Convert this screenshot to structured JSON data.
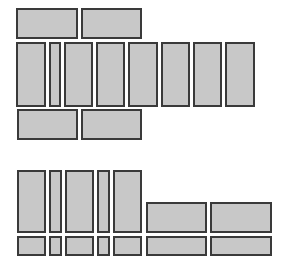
{
  "diagram": {
    "fill_color": "#c8c8c8",
    "border_color": "#3a3a3a",
    "background": "#ffffff",
    "groups": [
      {
        "name": "upper-group",
        "blocks": [
          {
            "x": 16,
            "y": 8,
            "w": 62,
            "h": 31
          },
          {
            "x": 81,
            "y": 8,
            "w": 61,
            "h": 31
          },
          {
            "x": 16,
            "y": 42,
            "w": 30,
            "h": 65
          },
          {
            "x": 49,
            "y": 42,
            "w": 12,
            "h": 65
          },
          {
            "x": 64,
            "y": 42,
            "w": 29,
            "h": 65
          },
          {
            "x": 96,
            "y": 42,
            "w": 29,
            "h": 65
          },
          {
            "x": 128,
            "y": 42,
            "w": 30,
            "h": 65
          },
          {
            "x": 161,
            "y": 42,
            "w": 29,
            "h": 65
          },
          {
            "x": 193,
            "y": 42,
            "w": 29,
            "h": 65
          },
          {
            "x": 225,
            "y": 42,
            "w": 30,
            "h": 65
          },
          {
            "x": 17,
            "y": 109,
            "w": 61,
            "h": 31
          },
          {
            "x": 81,
            "y": 109,
            "w": 61,
            "h": 31
          }
        ]
      },
      {
        "name": "lower-group",
        "blocks": [
          {
            "x": 17,
            "y": 170,
            "w": 29,
            "h": 63
          },
          {
            "x": 49,
            "y": 170,
            "w": 13,
            "h": 63
          },
          {
            "x": 65,
            "y": 170,
            "w": 29,
            "h": 63
          },
          {
            "x": 97,
            "y": 170,
            "w": 13,
            "h": 63
          },
          {
            "x": 113,
            "y": 170,
            "w": 29,
            "h": 63
          },
          {
            "x": 146,
            "y": 202,
            "w": 61,
            "h": 31
          },
          {
            "x": 210,
            "y": 202,
            "w": 62,
            "h": 31
          },
          {
            "x": 17,
            "y": 236,
            "w": 29,
            "h": 20
          },
          {
            "x": 49,
            "y": 236,
            "w": 13,
            "h": 20
          },
          {
            "x": 65,
            "y": 236,
            "w": 29,
            "h": 20
          },
          {
            "x": 97,
            "y": 236,
            "w": 13,
            "h": 20
          },
          {
            "x": 113,
            "y": 236,
            "w": 29,
            "h": 20
          },
          {
            "x": 146,
            "y": 236,
            "w": 61,
            "h": 20
          },
          {
            "x": 210,
            "y": 236,
            "w": 62,
            "h": 20
          }
        ]
      }
    ]
  }
}
